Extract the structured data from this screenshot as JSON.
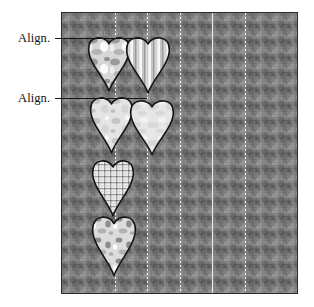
{
  "diagram": {
    "type": "sewing-quilting-instruction",
    "callouts": [
      {
        "id": "align-top",
        "label": "Align.",
        "label_x": 18,
        "label_y": 31,
        "leader_x1": 55,
        "leader_y": 38,
        "leader_x2": 143
      },
      {
        "id": "align-second",
        "label": "Align.",
        "label_x": 18,
        "label_y": 91,
        "leader_x1": 55,
        "leader_y": 98,
        "leader_x2": 147
      }
    ],
    "panel": {
      "name": "patterned-fabric-panel",
      "x": 62,
      "y": 13,
      "width": 235,
      "height": 280,
      "fill_color": "#838383",
      "border_color": "#2b2b2b",
      "texture": "printed-calico-mottled-gray"
    },
    "guides": [
      {
        "id": "guide-1",
        "x": 115,
        "style": "dotted",
        "color": "#f8f8f8"
      },
      {
        "id": "guide-2",
        "x": 147,
        "style": "dotted",
        "color": "#f8f8f8"
      },
      {
        "id": "guide-3",
        "x": 180,
        "style": "dotted",
        "color": "#f8f8f8"
      },
      {
        "id": "guide-4",
        "x": 212,
        "style": "solid",
        "color": "#ececec"
      },
      {
        "id": "guide-5",
        "x": 245,
        "style": "dotted",
        "color": "#f8f8f8"
      }
    ],
    "hearts": [
      {
        "id": "heart-1",
        "column": "left",
        "fabric": "mottled-marble-light",
        "x": 88,
        "y": 35,
        "width": 42,
        "height": 56,
        "outline_color": "#141414",
        "fill_color": "#d7d7d7"
      },
      {
        "id": "heart-2",
        "column": "right",
        "fabric": "vertical-stripe",
        "x": 126,
        "y": 35,
        "width": 44,
        "height": 58,
        "outline_color": "#141414",
        "fill_color": "#cfcfcf"
      },
      {
        "id": "heart-3",
        "column": "left",
        "fabric": "mottled-marble-pale",
        "x": 90,
        "y": 95,
        "width": 43,
        "height": 58,
        "outline_color": "#141414",
        "fill_color": "#dedede"
      },
      {
        "id": "heart-4",
        "column": "right",
        "fabric": "solid-pale-mottle",
        "x": 130,
        "y": 98,
        "width": 44,
        "height": 57,
        "outline_color": "#141414",
        "fill_color": "#e2e2e2"
      },
      {
        "id": "heart-5",
        "column": "left",
        "fabric": "gingham-check",
        "x": 92,
        "y": 158,
        "width": 42,
        "height": 58,
        "outline_color": "#141414",
        "fill_color": "#e0e0e0"
      },
      {
        "id": "heart-6",
        "column": "left",
        "fabric": "mottled-marble-spotty",
        "x": 92,
        "y": 214,
        "width": 44,
        "height": 62,
        "outline_color": "#141414",
        "fill_color": "#d9d9d9"
      }
    ],
    "colors": {
      "background": "#ffffff",
      "panel_gray": "#838383",
      "ink": "#141414",
      "guide_light": "#f8f8f8"
    }
  }
}
